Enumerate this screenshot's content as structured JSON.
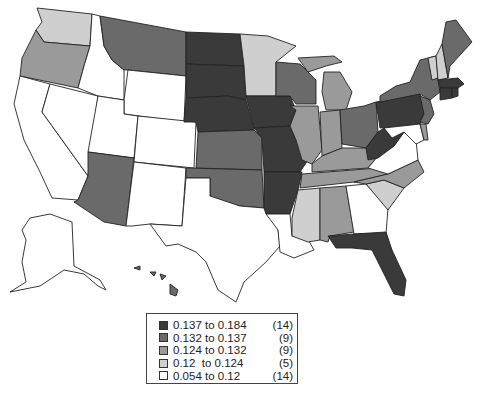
{
  "map": {
    "title": "",
    "type": "choropleth",
    "region": "United States",
    "classes": [
      {
        "label": "0.137 to 0.184",
        "count": "(14)",
        "color": "#3a3a3a"
      },
      {
        "label": "0.132 to 0.137",
        "count": "(9)",
        "color": "#6a6a6a"
      },
      {
        "label": "0.124 to 0.132",
        "count": "(9)",
        "color": "#9a9a9a"
      },
      {
        "label": "0.12  to 0.124",
        "count": "(5)",
        "color": "#cfcfcf"
      },
      {
        "label": "0.054 to 0.12",
        "count": "(14)",
        "color": "#ffffff"
      }
    ],
    "states": {
      "WA": 3,
      "OR": 2,
      "CA": 4,
      "NV": 4,
      "ID": 4,
      "MT": 1,
      "WY": 4,
      "UT": 4,
      "AZ": 1,
      "CO": 4,
      "NM": 4,
      "ND": 0,
      "SD": 0,
      "NE": 0,
      "KS": 1,
      "OK": 1,
      "TX": 4,
      "MN": 3,
      "IA": 0,
      "MO": 0,
      "AR": 0,
      "LA": 4,
      "WI": 1,
      "IL": 2,
      "MI": 2,
      "IN": 2,
      "OH": 1,
      "KY": 2,
      "TN": 2,
      "MS": 3,
      "AL": 2,
      "GA": 4,
      "FL": 0,
      "SC": 3,
      "NC": 2,
      "VA": 4,
      "WV": 0,
      "PA": 0,
      "NY": 1,
      "NJ": 1,
      "DE": 2,
      "MD": 4,
      "ME": 1,
      "VT": 3,
      "NH": 3,
      "MA": 0,
      "CT": 0,
      "RI": 0,
      "AK": 4,
      "HI": 1
    }
  },
  "legend": {
    "rows": [
      {
        "range": "0.137 to 0.184",
        "count": "(14)"
      },
      {
        "range": "0.132 to 0.137",
        "count": "(9)"
      },
      {
        "range": "0.124 to 0.132",
        "count": "(9)"
      },
      {
        "range": "0.12  to 0.124",
        "count": "(5)"
      },
      {
        "range": "0.054 to 0.12",
        "count": "(14)"
      }
    ]
  }
}
